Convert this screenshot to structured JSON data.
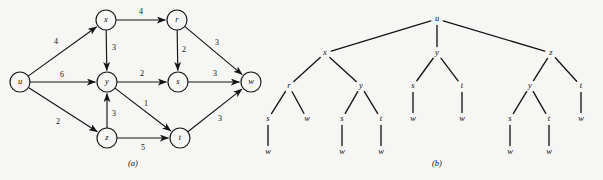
{
  "figure": {
    "background": "#f6f6f5",
    "ink": "#151515",
    "panels": [
      {
        "id": "a",
        "caption": "(a)",
        "caption_x": 133,
        "caption_y": 166
      },
      {
        "id": "b",
        "caption": "(b)",
        "caption_x": 437,
        "caption_y": 166
      }
    ]
  },
  "graph": {
    "title": "weighted directed graph",
    "node_radius": 10,
    "nodes": [
      {
        "id": "u",
        "label": "u",
        "x": 20,
        "y": 82
      },
      {
        "id": "x",
        "label": "x",
        "x": 106,
        "y": 20
      },
      {
        "id": "y",
        "label": "y",
        "x": 107,
        "y": 82
      },
      {
        "id": "z",
        "label": "z",
        "x": 107,
        "y": 138
      },
      {
        "id": "r",
        "label": "r",
        "x": 177,
        "y": 20
      },
      {
        "id": "s",
        "label": "s",
        "x": 178,
        "y": 82
      },
      {
        "id": "t",
        "label": "t",
        "x": 180,
        "y": 138
      },
      {
        "id": "w",
        "label": "w",
        "x": 251,
        "y": 82
      }
    ],
    "edges": [
      {
        "from": "u",
        "to": "x",
        "weight": "4",
        "wx": 56,
        "wy": 42
      },
      {
        "from": "u",
        "to": "y",
        "weight": "6",
        "wx": 62,
        "wy": 75
      },
      {
        "from": "u",
        "to": "z",
        "weight": "2",
        "wx": 58,
        "wy": 122
      },
      {
        "from": "x",
        "to": "r",
        "weight": "4",
        "wx": 141,
        "wy": 12
      },
      {
        "from": "x",
        "to": "y",
        "weight": "3",
        "wx": 114,
        "wy": 48
      },
      {
        "from": "z",
        "to": "y",
        "weight": "3",
        "wx": 114,
        "wy": 114
      },
      {
        "from": "z",
        "to": "t",
        "weight": "5",
        "wx": 143,
        "wy": 148
      },
      {
        "from": "y",
        "to": "s",
        "weight": "2",
        "wx": 142,
        "wy": 74
      },
      {
        "from": "y",
        "to": "t",
        "weight": "1",
        "wx": 146,
        "wy": 104
      },
      {
        "from": "r",
        "to": "s",
        "weight": "2",
        "wx": 184,
        "wy": 50
      },
      {
        "from": "r",
        "to": "w",
        "weight": "3",
        "wx": 217,
        "wy": 43
      },
      {
        "from": "s",
        "to": "w",
        "weight": "3",
        "wx": 215,
        "wy": 74
      },
      {
        "from": "t",
        "to": "w",
        "weight": "3",
        "wx": 220,
        "wy": 119
      }
    ]
  },
  "tree": {
    "title": "breadth/depth traversal tree rooted at u",
    "nodes": [
      {
        "id": "n0",
        "label": "u",
        "x": 437,
        "y": 19
      },
      {
        "id": "n1",
        "label": "x",
        "x": 325,
        "y": 53
      },
      {
        "id": "n2",
        "label": "y",
        "x": 437,
        "y": 53
      },
      {
        "id": "n3",
        "label": "z",
        "x": 551,
        "y": 53
      },
      {
        "id": "n4",
        "label": "r",
        "x": 289,
        "y": 86
      },
      {
        "id": "n5",
        "label": "y",
        "x": 361,
        "y": 86
      },
      {
        "id": "n6",
        "label": "s",
        "x": 413,
        "y": 86
      },
      {
        "id": "n7",
        "label": "t",
        "x": 462,
        "y": 86
      },
      {
        "id": "n8",
        "label": "y",
        "x": 530,
        "y": 86
      },
      {
        "id": "n9",
        "label": "t",
        "x": 581,
        "y": 86
      },
      {
        "id": "n10",
        "label": "s",
        "x": 268,
        "y": 119
      },
      {
        "id": "n11",
        "label": "w",
        "x": 307,
        "y": 119
      },
      {
        "id": "n12",
        "label": "s",
        "x": 342,
        "y": 119
      },
      {
        "id": "n13",
        "label": "t",
        "x": 381,
        "y": 119
      },
      {
        "id": "n14",
        "label": "w",
        "x": 413,
        "y": 119
      },
      {
        "id": "n15",
        "label": "w",
        "x": 462,
        "y": 119
      },
      {
        "id": "n16",
        "label": "s",
        "x": 510,
        "y": 119
      },
      {
        "id": "n17",
        "label": "t",
        "x": 549,
        "y": 119
      },
      {
        "id": "n18",
        "label": "w",
        "x": 581,
        "y": 119
      },
      {
        "id": "n19",
        "label": "w",
        "x": 268,
        "y": 152
      },
      {
        "id": "n20",
        "label": "w",
        "x": 342,
        "y": 152
      },
      {
        "id": "n21",
        "label": "w",
        "x": 381,
        "y": 152
      },
      {
        "id": "n22",
        "label": "w",
        "x": 510,
        "y": 152
      },
      {
        "id": "n23",
        "label": "w",
        "x": 549,
        "y": 152
      }
    ],
    "edges": [
      [
        "n0",
        "n1"
      ],
      [
        "n0",
        "n2"
      ],
      [
        "n0",
        "n3"
      ],
      [
        "n1",
        "n4"
      ],
      [
        "n1",
        "n5"
      ],
      [
        "n2",
        "n6"
      ],
      [
        "n2",
        "n7"
      ],
      [
        "n3",
        "n8"
      ],
      [
        "n3",
        "n9"
      ],
      [
        "n4",
        "n10"
      ],
      [
        "n4",
        "n11"
      ],
      [
        "n5",
        "n12"
      ],
      [
        "n5",
        "n13"
      ],
      [
        "n6",
        "n14"
      ],
      [
        "n7",
        "n15"
      ],
      [
        "n8",
        "n16"
      ],
      [
        "n8",
        "n17"
      ],
      [
        "n9",
        "n18"
      ],
      [
        "n10",
        "n19"
      ],
      [
        "n12",
        "n20"
      ],
      [
        "n13",
        "n21"
      ],
      [
        "n16",
        "n22"
      ],
      [
        "n17",
        "n23"
      ]
    ]
  }
}
